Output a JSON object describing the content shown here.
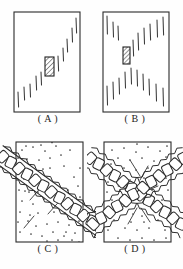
{
  "figure": {
    "background_color": "#fefefe",
    "ink_color": "#2b2b2b",
    "panel_count": 4,
    "layout": "2x2 grid of bordered rectangular diagram panels with centered captions below each"
  },
  "panels": [
    {
      "id": "A",
      "label": "( A )",
      "caption_letter": "A",
      "frame": {
        "x": 14,
        "y": 12,
        "width": 66,
        "height": 100
      },
      "style": {
        "fill": "#ffffff",
        "stroke": "#2b2b2b",
        "stroke_width": 1.1
      },
      "content_kind": "tick-array-diagonal",
      "description": "Plain rectangle containing short vertical tick marks arranged along a rising diagonal from lower-left to upper-right, with one hatched rectangular block near the centre.",
      "hatched_block": {
        "x": 45,
        "y": 57,
        "width": 9,
        "height": 19,
        "hatch_direction": "up-right",
        "hatch_spacing": 2.6
      },
      "ticks": [
        {
          "x": 18,
          "y": 92,
          "length": 15
        },
        {
          "x": 24,
          "y": 87,
          "length": 13
        },
        {
          "x": 30,
          "y": 84,
          "length": 13
        },
        {
          "x": 36,
          "y": 76,
          "length": 14
        },
        {
          "x": 41,
          "y": 72,
          "length": 13
        },
        {
          "x": 58,
          "y": 56,
          "length": 15
        },
        {
          "x": 63,
          "y": 48,
          "length": 13
        },
        {
          "x": 67,
          "y": 39,
          "length": 13
        },
        {
          "x": 72,
          "y": 28,
          "length": 14
        },
        {
          "x": 76,
          "y": 18,
          "length": 15
        }
      ]
    },
    {
      "id": "B",
      "label": "( B )",
      "caption_letter": "B",
      "frame": {
        "x": 103,
        "y": 12,
        "width": 66,
        "height": 100
      },
      "style": {
        "fill": "#ffffff",
        "stroke": "#2b2b2b",
        "stroke_width": 1.1
      },
      "content_kind": "tick-array-hourglass",
      "description": "Plain rectangle containing short vertical tick marks arranged in an X / hourglass pattern converging toward the centre, with one small hatched rectangular block left of centre.",
      "hatched_block": {
        "x": 123,
        "y": 47,
        "width": 7,
        "height": 17,
        "hatch_direction": "up-right",
        "hatch_spacing": 2.4
      },
      "ticks": [
        {
          "x": 107,
          "y": 16,
          "length": 18
        },
        {
          "x": 113,
          "y": 22,
          "length": 15
        },
        {
          "x": 118,
          "y": 26,
          "length": 14
        },
        {
          "x": 133,
          "y": 40,
          "length": 16
        },
        {
          "x": 138,
          "y": 33,
          "length": 17
        },
        {
          "x": 144,
          "y": 28,
          "length": 16
        },
        {
          "x": 150,
          "y": 24,
          "length": 16
        },
        {
          "x": 157,
          "y": 20,
          "length": 17
        },
        {
          "x": 163,
          "y": 17,
          "length": 18
        },
        {
          "x": 107,
          "y": 86,
          "length": 19
        },
        {
          "x": 113,
          "y": 82,
          "length": 17
        },
        {
          "x": 119,
          "y": 78,
          "length": 16
        },
        {
          "x": 125,
          "y": 72,
          "length": 16
        },
        {
          "x": 131,
          "y": 68,
          "length": 16
        },
        {
          "x": 137,
          "y": 70,
          "length": 16
        },
        {
          "x": 143,
          "y": 74,
          "length": 16
        },
        {
          "x": 149,
          "y": 79,
          "length": 16
        },
        {
          "x": 156,
          "y": 84,
          "length": 17
        },
        {
          "x": 163,
          "y": 88,
          "length": 18
        }
      ]
    },
    {
      "id": "C",
      "label": "( C )",
      "caption_letter": "C",
      "frame": {
        "x": 16,
        "y": 142,
        "width": 67,
        "height": 100
      },
      "style": {
        "fill": "#ffffff",
        "stroke": "#2b2b2b",
        "stroke_width": 1.1,
        "stipple": true,
        "stipple_color": "#333333",
        "stipple_count": 95
      },
      "content_kind": "chain-band-single-diagonal",
      "description": "Stippled rectangle crossed by one wavy band of linked rounded blocks running from the lower-left corner to the upper-right corner, overflowing the frame at both ends; a few short diagonal streak lines flank the band.",
      "bands": [
        {
          "x1": 12,
          "y1": 246,
          "x2": 88,
          "y2": 139,
          "blocks": 13,
          "band_width": 15
        }
      ],
      "streaks": [
        {
          "x1": 30,
          "y1": 200,
          "x2": 44,
          "y2": 184
        },
        {
          "x1": 48,
          "y1": 214,
          "x2": 64,
          "y2": 196
        },
        {
          "x1": 24,
          "y1": 228,
          "x2": 34,
          "y2": 216
        }
      ]
    },
    {
      "id": "D",
      "label": "( D )",
      "caption_letter": "D",
      "frame": {
        "x": 104,
        "y": 142,
        "width": 67,
        "height": 100
      },
      "style": {
        "fill": "#ffffff",
        "stroke": "#2b2b2b",
        "stroke_width": 1.1,
        "stipple": true,
        "stipple_color": "#333333",
        "stipple_count": 95
      },
      "content_kind": "chain-band-crossing-x",
      "description": "Stippled rectangle crossed by two wavy bands of linked rounded blocks forming an X that meets near the centre; short radiating streak lines fill the wedges between the bands.",
      "bands": [
        {
          "x1": 100,
          "y1": 246,
          "x2": 176,
          "y2": 139,
          "blocks": 12,
          "band_width": 14
        },
        {
          "x1": 100,
          "y1": 139,
          "x2": 176,
          "y2": 246,
          "blocks": 12,
          "band_width": 14
        }
      ],
      "streaks": [
        {
          "x1": 130,
          "y1": 160,
          "x2": 140,
          "y2": 176
        },
        {
          "x1": 148,
          "y1": 166,
          "x2": 140,
          "y2": 180
        },
        {
          "x1": 118,
          "y1": 186,
          "x2": 130,
          "y2": 190
        },
        {
          "x1": 158,
          "y1": 186,
          "x2": 146,
          "y2": 191
        },
        {
          "x1": 128,
          "y1": 224,
          "x2": 137,
          "y2": 208
        },
        {
          "x1": 150,
          "y1": 222,
          "x2": 141,
          "y2": 208
        },
        {
          "x1": 114,
          "y1": 206,
          "x2": 126,
          "y2": 200
        },
        {
          "x1": 160,
          "y1": 204,
          "x2": 150,
          "y2": 199
        }
      ]
    }
  ]
}
